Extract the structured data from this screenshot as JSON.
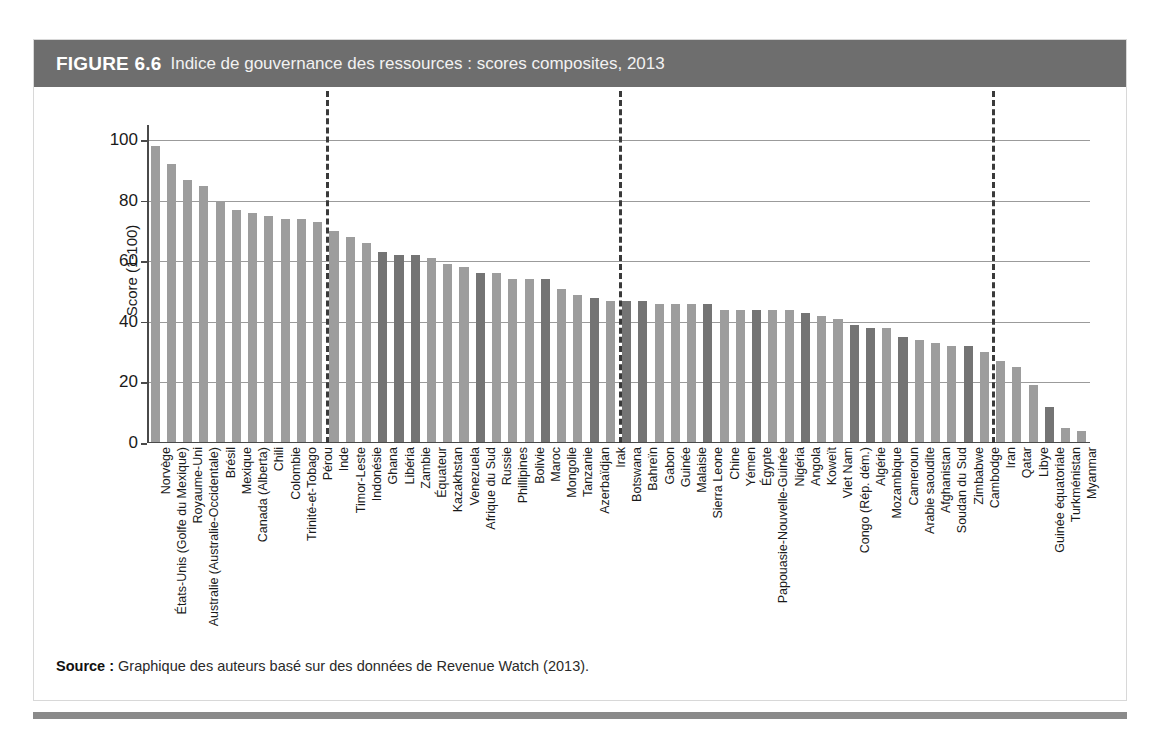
{
  "figure": {
    "label": "FIGURE 6.6",
    "caption": "Indice de gouvernance des ressources : scores composites, 2013",
    "source_label": "Source :",
    "source_text": "Graphique des auteurs basé sur des données de Revenue Watch (2013)."
  },
  "colors": {
    "title_bar": "#6e6e6e",
    "bar_light": "#9d9d9d",
    "bar_dark": "#747474",
    "gridline": "#9b9b9b",
    "axis": "#4a4a4a",
    "divider": "#3a3a3a",
    "bottom_rule": "#8a8a8a"
  },
  "chart_data": {
    "type": "bar",
    "title": "Indice de gouvernance des ressources : scores composites, 2013",
    "xlabel": "",
    "ylabel": "Score (1-100)",
    "ylim": [
      0,
      105
    ],
    "yticks": [
      0,
      20,
      40,
      60,
      80,
      100
    ],
    "ytick_labels": [
      "0",
      "20",
      "40",
      "60",
      "80",
      "100"
    ],
    "grid": true,
    "legend": "none",
    "dividers": [
      {
        "after_category": "Pérou",
        "after_index": 10
      },
      {
        "after_category": "Mongolie",
        "after_index": 28
      },
      {
        "after_category": "Viet Nam",
        "after_index": 51
      }
    ],
    "categories": [
      "Norvège",
      "États-Unis (Golfe du Mexique)",
      "Royaume-Uni",
      "Australie (Australie-Occidentale)",
      "Brésil",
      "Mexique",
      "Canada (Alberta)",
      "Chili",
      "Colombie",
      "Trinité-et-Tobago",
      "Pérou",
      "Inde",
      "Timor-Leste",
      "Indonésie",
      "Ghana",
      "Libéria",
      "Zambie",
      "Équateur",
      "Kazakhstan",
      "Venezuela",
      "Afrique du Sud",
      "Russie",
      "Phillipines",
      "Bolivie",
      "Maroc",
      "Mongolie",
      "Tanzanie",
      "Azerbaïdjan",
      "Irak",
      "Botswana",
      "Bahreïn",
      "Gabon",
      "Guinée",
      "Malaisie",
      "Sierra Leone",
      "Chine",
      "Yémen",
      "Égypte",
      "Papouasie-Nouvelle-Guinée",
      "Nigéria",
      "Angola",
      "Koweït",
      "Viet Nam",
      "Congo (Rép. dém.)",
      "Algérie",
      "Mozambique",
      "Cameroun",
      "Arabie saoudite",
      "Afghanistan",
      "Soudan du Sud",
      "Zimbabwe",
      "Cambodge",
      "Iran",
      "Qatar",
      "Libye",
      "Guinée équatoriale",
      "Turkménistan",
      "Myanmar"
    ],
    "values": [
      98,
      92,
      87,
      85,
      80,
      77,
      76,
      75,
      74,
      74,
      73,
      70,
      68,
      66,
      63,
      62,
      62,
      61,
      59,
      58,
      56,
      56,
      54,
      54,
      54,
      51,
      49,
      48,
      47,
      47,
      47,
      46,
      46,
      46,
      46,
      44,
      44,
      44,
      44,
      44,
      43,
      42,
      41,
      39,
      38,
      38,
      35,
      34,
      33,
      32,
      32,
      30,
      27,
      25,
      19,
      12,
      5,
      4
    ],
    "shades": [
      "light",
      "light",
      "light",
      "light",
      "light",
      "light",
      "light",
      "light",
      "light",
      "light",
      "light",
      "light",
      "light",
      "light",
      "dark",
      "dark",
      "dark",
      "light",
      "light",
      "light",
      "dark",
      "light",
      "light",
      "light",
      "dark",
      "light",
      "light",
      "dark",
      "light",
      "dark",
      "dark",
      "light",
      "light",
      "light",
      "dark",
      "light",
      "light",
      "dark",
      "light",
      "light",
      "dark",
      "light",
      "light",
      "dark",
      "dark",
      "light",
      "dark",
      "light",
      "light",
      "light",
      "dark",
      "light",
      "light",
      "light",
      "light",
      "dark",
      "light",
      "light"
    ]
  }
}
